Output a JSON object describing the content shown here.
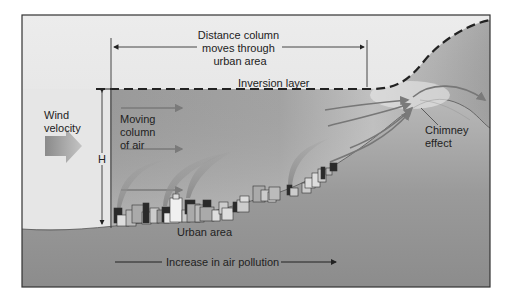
{
  "diagram": {
    "labels": {
      "distance": [
        "Distance column",
        "moves through",
        "urban area"
      ],
      "inversion_layer": "Inversion layer",
      "wind_velocity": [
        "Wind",
        "velocity"
      ],
      "moving_column": [
        "Moving",
        "column",
        "of air"
      ],
      "height": "H",
      "chimney_effect": [
        "Chimney",
        "effect"
      ],
      "urban_area": "Urban area",
      "increase_pollution": "Increase in air pollution"
    },
    "colors": {
      "frame_border": "#333333",
      "sky_light": "#e8e8e8",
      "air_column": "#a8a8a8",
      "ground_dark": "#8a8a8a",
      "arrow_gray": "#888888",
      "text": "#222222"
    }
  }
}
